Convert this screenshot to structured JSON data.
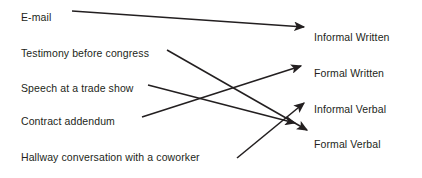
{
  "diagram": {
    "type": "matching-diagram",
    "width": 422,
    "height": 178,
    "background_color": "#ffffff",
    "line_color": "#231f20",
    "text_color": "#231f20",
    "left_column": {
      "items": [
        {
          "id": "email",
          "label": "E-mail",
          "x": 21,
          "y": 17
        },
        {
          "id": "testimony",
          "label": "Testimony before congress",
          "x": 21,
          "y": 53
        },
        {
          "id": "speech",
          "label": "Speech at a trade show",
          "x": 21,
          "y": 88
        },
        {
          "id": "contract",
          "label": "Contract addendum",
          "x": 21,
          "y": 121
        },
        {
          "id": "hallway",
          "label": "Hallway conversation with a coworker",
          "x": 21,
          "y": 157
        }
      ]
    },
    "right_column": {
      "items": [
        {
          "id": "informal-written",
          "label": "Informal Written",
          "x": 314,
          "y": 37
        },
        {
          "id": "formal-written",
          "label": "Formal Written",
          "x": 314,
          "y": 73
        },
        {
          "id": "informal-verbal",
          "label": "Informal Verbal",
          "x": 314,
          "y": 109
        },
        {
          "id": "formal-verbal",
          "label": "Formal Verbal",
          "x": 314,
          "y": 144
        }
      ]
    },
    "connections": [
      {
        "id": "email-to-informal-written",
        "from": "email",
        "to": "informal-written",
        "x1": 72,
        "y1": 11,
        "x2": 304,
        "y2": 27
      },
      {
        "id": "testimony-to-formal-verbal",
        "from": "testimony",
        "to": "formal-verbal",
        "x1": 167,
        "y1": 50,
        "x2": 307,
        "y2": 130
      },
      {
        "id": "speech-to-formal-verbal",
        "from": "speech",
        "to": "formal-verbal",
        "x1": 148,
        "y1": 85,
        "x2": 295,
        "y2": 123
      },
      {
        "id": "contract-to-formal-written",
        "from": "contract",
        "to": "formal-written",
        "x1": 142,
        "y1": 117,
        "x2": 301,
        "y2": 66
      },
      {
        "id": "hallway-to-informal-verbal",
        "from": "hallway",
        "to": "informal-verbal",
        "x1": 237,
        "y1": 158,
        "x2": 304,
        "y2": 103
      }
    ]
  }
}
